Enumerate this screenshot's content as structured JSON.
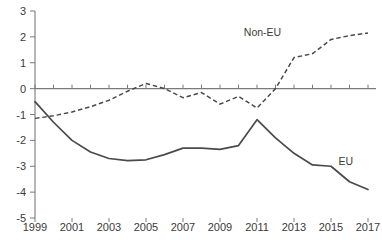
{
  "chart_data": {
    "type": "line",
    "title": "",
    "xlabel": "",
    "ylabel": "",
    "ylim": [
      -5,
      3
    ],
    "xlim": [
      1999,
      2017
    ],
    "grid": false,
    "legend_position": "inline-annotation",
    "y_ticks": [
      "3",
      "2",
      "1",
      "0",
      "-1",
      "-2",
      "-3",
      "-4",
      "-5"
    ],
    "y_tick_values": [
      3,
      2,
      1,
      0,
      -1,
      -2,
      -3,
      -4,
      -5
    ],
    "x_ticks": [
      "1999",
      "2001",
      "2003",
      "2005",
      "2007",
      "2009",
      "2011",
      "2013",
      "2015",
      "2017"
    ],
    "x_tick_values": [
      1999,
      2001,
      2003,
      2005,
      2007,
      2009,
      2011,
      2013,
      2015,
      2017
    ],
    "x": [
      1999,
      2000,
      2001,
      2002,
      2003,
      2004,
      2005,
      2006,
      2007,
      2008,
      2009,
      2010,
      2011,
      2012,
      2013,
      2014,
      2015,
      2016,
      2017
    ],
    "series": [
      {
        "name": "EU",
        "style": "solid",
        "label": "EU",
        "label_x": 2015.8,
        "label_y": -2.95,
        "values": [
          -0.5,
          -1.3,
          -2.0,
          -2.45,
          -2.7,
          -2.78,
          -2.75,
          -2.55,
          -2.3,
          -2.3,
          -2.35,
          -2.2,
          -1.2,
          -1.9,
          -2.5,
          -2.95,
          -3.0,
          -3.6,
          -3.9
        ]
      },
      {
        "name": "Non-EU",
        "style": "dashed",
        "label": "Non-EU",
        "label_x": 2011.3,
        "label_y": 2.05,
        "values": [
          -1.15,
          -1.05,
          -0.9,
          -0.7,
          -0.45,
          -0.1,
          0.2,
          0.0,
          -0.35,
          -0.15,
          -0.6,
          -0.3,
          -0.75,
          0.0,
          1.2,
          1.35,
          1.9,
          2.05,
          2.15
        ]
      }
    ]
  },
  "axes": {
    "y_axis_name": "y-axis",
    "x_axis_name": "x-axis",
    "zero_line_value": "0"
  },
  "edges": {
    "top_cropped_text": "",
    "bottom_cropped_text": ""
  }
}
